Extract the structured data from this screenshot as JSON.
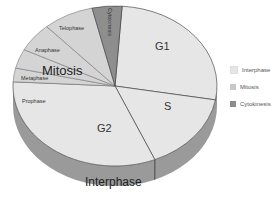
{
  "chart_data": {
    "type": "pie",
    "style": "3d",
    "title": "",
    "slices": [
      {
        "label": "G1",
        "group": "Interphase",
        "start_deg": -86,
        "end_deg": 10,
        "label_pos": [
          155,
          50
        ],
        "label_size": 11
      },
      {
        "label": "S",
        "group": "Interphase",
        "start_deg": 10,
        "end_deg": 67,
        "label_pos": [
          164,
          110
        ],
        "label_size": 11
      },
      {
        "label": "G2",
        "group": "Interphase",
        "start_deg": 67,
        "end_deg": 183,
        "label_pos": [
          97,
          132
        ],
        "label_size": 11
      },
      {
        "label": "Prophase",
        "group": "Mitosis",
        "start_deg": 183,
        "end_deg": 193,
        "label_pos": [
          22,
          103
        ],
        "label_size": 5.5
      },
      {
        "label": "Metaphase",
        "group": "Mitosis",
        "start_deg": 193,
        "end_deg": 207,
        "label_pos": [
          21,
          80
        ],
        "label_size": 5.5
      },
      {
        "label": "Anaphase",
        "group": "Mitosis",
        "start_deg": 207,
        "end_deg": 228,
        "label_pos": [
          35,
          52
        ],
        "label_size": 5.5
      },
      {
        "label": "Telophase",
        "group": "Mitosis",
        "start_deg": 228,
        "end_deg": 257,
        "label_pos": [
          59,
          30
        ],
        "label_size": 5.5
      },
      {
        "label": "Cytokinesis",
        "group": "Cytokinesis",
        "start_deg": 257,
        "end_deg": 274,
        "label_pos": [
          108,
          8
        ],
        "label_size": 5.5,
        "rotate": 90
      }
    ],
    "group_labels": [
      {
        "label": "Mitosis",
        "pos": [
          42,
          75
        ],
        "size": 13
      },
      {
        "label": "Interphase",
        "pos": [
          85,
          186
        ],
        "size": 12
      }
    ],
    "legend": {
      "position": "right",
      "entries": [
        {
          "label": "Interphase",
          "color": "#e6e6e6"
        },
        {
          "label": "Mitosis",
          "color": "#c8c8c8"
        },
        {
          "label": "Cytokinesis",
          "color": "#8c8c8c"
        }
      ]
    },
    "colors": {
      "Interphase": "#e6e6e6",
      "Mitosis": "#d4d4d4",
      "Cytokinesis": "#8e8e8e",
      "side": "#9a9a9a",
      "divider": "#333333"
    }
  },
  "legend": {
    "items": [
      {
        "label": "Interphase",
        "color": "#e6e6e6"
      },
      {
        "label": "Mitosis",
        "color": "#c8c8c8"
      },
      {
        "label": "Cytokinesis",
        "color": "#8c8c8c"
      }
    ]
  }
}
